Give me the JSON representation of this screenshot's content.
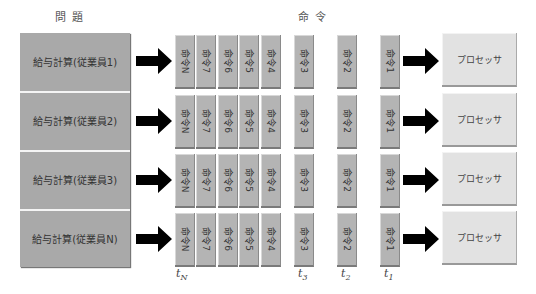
{
  "headers": {
    "problem": "問題",
    "instruction": "命令"
  },
  "problems": [
    {
      "label": "給与計算(従業員1)"
    },
    {
      "label": "給与計算(従業員2)"
    },
    {
      "label": "給与計算(従業員3)"
    },
    {
      "label": "給与計算(従業員N)"
    }
  ],
  "instructions": [
    "命令N",
    "命令7",
    "命令6",
    "命令5",
    "命令4",
    "命令3",
    "命令2",
    "命令1"
  ],
  "processor_label": "プロセッサ",
  "time_labels": {
    "tN": "N",
    "t3": "3",
    "t2": "2",
    "t1": "1",
    "t": "t"
  },
  "colors": {
    "problem_bg": "#a9a9a9",
    "instruction_bg": "#b4b4b4",
    "processor_bg": "#e2e2e2",
    "arrow": "#000000"
  }
}
